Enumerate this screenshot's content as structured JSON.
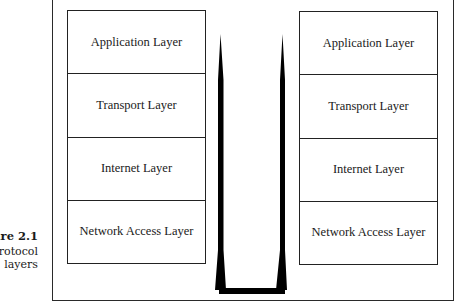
{
  "figure": {
    "label": "Figure 2.1",
    "visible_label": "ure 2.1",
    "caption_lines": [
      "rotocol",
      "layers"
    ]
  },
  "stacks": {
    "left": {
      "layers": [
        {
          "label": "Application Layer"
        },
        {
          "label": "Transport Layer"
        },
        {
          "label": "Internet Layer"
        },
        {
          "label": "Network Access Layer"
        }
      ]
    },
    "right": {
      "layers": [
        {
          "label": "Application Layer"
        },
        {
          "label": "Transport Layer"
        },
        {
          "label": "Internet Layer"
        },
        {
          "label": "Network Access Layer"
        }
      ]
    }
  },
  "connector": {
    "shape": "U-shaped tapered path",
    "color": "#000000"
  }
}
